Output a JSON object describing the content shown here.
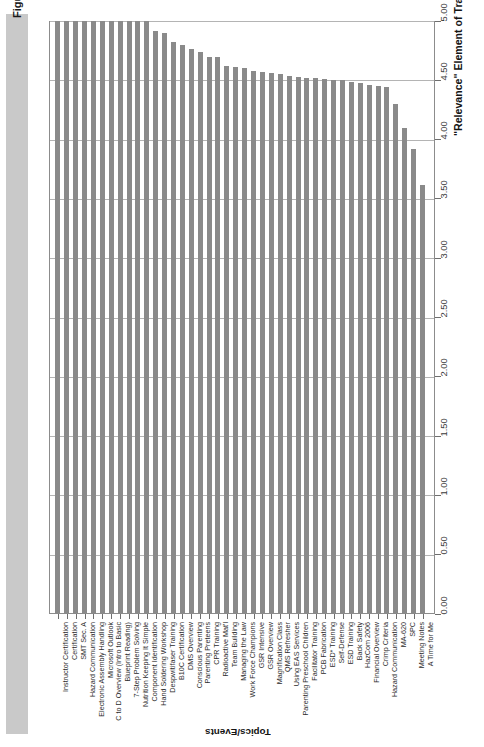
{
  "figure": {
    "title": "Figure 28-5. Relevance Evaluations for a Five-Year Period",
    "title_band_color": "#c9c9c9",
    "bar_color": "#8a8a8a",
    "grid_color": "#b4b4b4",
    "frame_color": "#8c8c8c"
  },
  "chart_data": {
    "type": "bar",
    "orientation": "vertical-rotated",
    "title": "Figure 28-5. Relevance Evaluations for a Five-Year Period",
    "xlabel": "Topics/Events",
    "ylabel": "\"Relevance\" Element of Training Assessment and Design (Scale of 1 to 5)",
    "ylim": [
      0.0,
      5.0
    ],
    "ytick_labels": [
      "0.00",
      "0.50",
      "1.00",
      "1.50",
      "2.00",
      "2.50",
      "3.00",
      "3.50",
      "4.00",
      "4.50",
      "5.00"
    ],
    "ytick_values": [
      0.0,
      0.5,
      1.0,
      1.5,
      2.0,
      2.5,
      3.0,
      3.5,
      4.0,
      4.5,
      5.0
    ],
    "grid": true,
    "legend": null,
    "categories": [
      "Instructor Certification",
      "Certification",
      "SMT Sec. A",
      "Hazard Communication",
      "Electronic Assembly Handling",
      "Microsoft Outlook",
      "C to D Overview (Intro to Basic",
      "Blueprint Reading)",
      "7-Step Problem Solving",
      "Nutrition Keeping It Simple",
      "Component Identification",
      "Hand Soldering Workshop",
      "Despwitifaser Training",
      "B10C Certification",
      "DMS Overview",
      "Conscious Parenting",
      "Parenting Preteens",
      "CPR Training",
      "Radioactive Mat'l",
      "Team Building",
      "Managing the Law",
      "Work Force Champions",
      "GSR Intensive",
      "GSR Overview",
      "Magnification Class",
      "QMS Refresher",
      "Using EAS Services",
      "Parenting Preschool Children",
      "Facilitator Training",
      "PCB Fabrication",
      "ESD* Training",
      "Self-Defense",
      "ESD Training",
      "Back Safety",
      "HazCom 2006",
      "Financial Overview",
      "Crimp Criteria",
      "Hazard Communication",
      "MA-620",
      "SPC",
      "Meeting Notes",
      "A Time for Me"
    ],
    "values": [
      5.0,
      5.0,
      5.0,
      5.0,
      5.0,
      5.0,
      5.0,
      5.0,
      5.0,
      5.0,
      5.0,
      4.92,
      4.9,
      4.82,
      4.8,
      4.76,
      4.74,
      4.7,
      4.7,
      4.62,
      4.61,
      4.6,
      4.58,
      4.57,
      4.56,
      4.55,
      4.54,
      4.53,
      4.52,
      4.52,
      4.51,
      4.5,
      4.5,
      4.49,
      4.48,
      4.46,
      4.45,
      4.44,
      4.3,
      4.1,
      3.92,
      3.62
    ]
  }
}
